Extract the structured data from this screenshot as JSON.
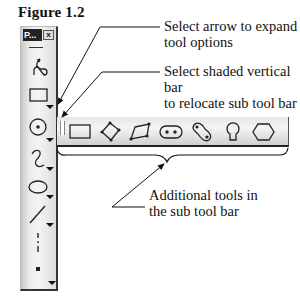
{
  "figure": {
    "title": "Figure 1.2"
  },
  "callouts": [
    {
      "line1": "Select arrow to expand",
      "line2": "tool options"
    },
    {
      "line1": "Select shaded vertical bar",
      "line2": "to relocate sub tool bar"
    },
    {
      "line1": "Additional tools in",
      "line2": "the sub tool bar"
    }
  ],
  "toolbar": {
    "title_label": "P...",
    "close_label": "x",
    "tools": [
      {
        "name": "profile-tool",
        "icon": "profile-icon"
      },
      {
        "name": "rectangle-tool",
        "icon": "rectangle-icon",
        "has_flyout": true
      },
      {
        "name": "circle-tool",
        "icon": "circle-center-icon",
        "has_flyout": true,
        "active": true
      },
      {
        "name": "arc-tool",
        "icon": "arc-icon",
        "has_flyout": true
      },
      {
        "name": "ellipse-tool",
        "icon": "ellipse-icon",
        "has_flyout": true
      },
      {
        "name": "line-tool",
        "icon": "line-icon",
        "has_flyout": true
      },
      {
        "name": "axis-tool",
        "icon": "axis-icon"
      },
      {
        "name": "point-tool",
        "icon": "point-icon",
        "has_flyout": true
      }
    ]
  },
  "subtoolbar": {
    "tools": [
      {
        "name": "rectangle",
        "icon": "rectangle-icon"
      },
      {
        "name": "oriented-rectangle",
        "icon": "oriented-rectangle-icon"
      },
      {
        "name": "parallelogram",
        "icon": "parallelogram-icon"
      },
      {
        "name": "elongated-hole",
        "icon": "elongated-hole-icon"
      },
      {
        "name": "cylindrical-elongated-hole",
        "icon": "cylindrical-hole-icon"
      },
      {
        "name": "keyhole-profile",
        "icon": "keyhole-icon"
      },
      {
        "name": "hexagon",
        "icon": "hexagon-icon"
      }
    ]
  }
}
